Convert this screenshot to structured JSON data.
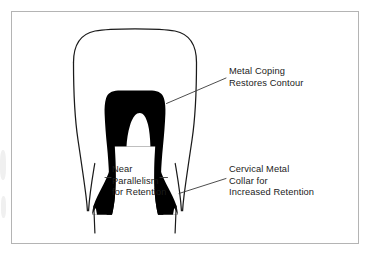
{
  "figure": {
    "kind": "dental-illustration",
    "background_color": "#ffffff",
    "frame_color": "#b4b4b4",
    "ink_color": "#000000",
    "text_color": "#1b1b1b",
    "leader_color": "#3a3a3a"
  },
  "labels": {
    "metal_coping": {
      "name": "metal-coping-label",
      "line1": "Metal Coping",
      "line2": "Restores Contour"
    },
    "cervical_collar": {
      "name": "cervical-metal-collar-label",
      "line1": "Cervical Metal",
      "line2": "Collar for",
      "line3": "Increased Retention"
    },
    "near_parallelism": {
      "name": "near-parallelism-label",
      "line1": "Near",
      "line2": "Parallelism",
      "line3": "for Retention"
    }
  },
  "parts": {
    "crown_outline": "full-contour-crown-outline",
    "coping": "metal-coping-body",
    "root_left": "root-outline-left",
    "root_right": "root-outline-right",
    "collar_left": "cervical-collar-left",
    "collar_right": "cervical-collar-right"
  },
  "leaders": {
    "metal_coping_leader": "leader-line-to-coping-shoulder",
    "cervical_collar_leader": "leader-line-to-cervical-collar",
    "parallelism_leader_left": "leader-dash-left",
    "parallelism_leader_right": "leader-dash-right"
  }
}
